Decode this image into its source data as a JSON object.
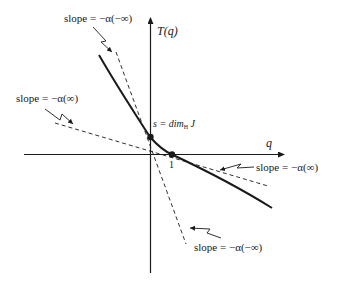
{
  "diagram": {
    "title": "",
    "axes": {
      "x_label": "q",
      "y_label": "T(q)"
    },
    "points": [
      {
        "id": "s",
        "label_prefix": "s = dim",
        "label_sub": "H",
        "label_suffix": " J"
      },
      {
        "id": "one",
        "label": "1"
      }
    ],
    "annotations": {
      "top_left_steep": "slope = −α(−∞)",
      "left_shallow": "slope = −α(∞)",
      "right_shallow": "slope = −α(∞)",
      "bottom_steep": "slope = −α(−∞)"
    },
    "colors": {
      "ink": "#1a1a1a",
      "background": "#ffffff"
    }
  }
}
